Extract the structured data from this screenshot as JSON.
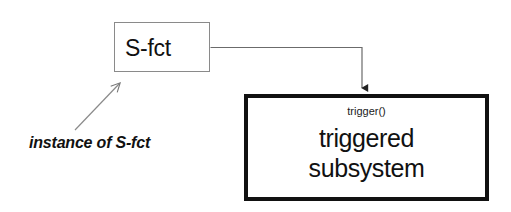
{
  "diagram": {
    "type": "block-diagram",
    "background_color": "#ffffff",
    "blocks": [
      {
        "id": "s-fct",
        "label": "S-fct",
        "border_color": "#8a8a8a",
        "fill_color": "#ffffff"
      },
      {
        "id": "triggered-subsystem",
        "port_label": "trigger()",
        "name_line_1": "triggered",
        "name_line_2": "subsystem",
        "border_color": "#111111",
        "fill_color": "#ffffff"
      }
    ],
    "connection": {
      "from": "s-fct",
      "to": "triggered-subsystem",
      "style": "orthogonal-arrow",
      "color": "#555555"
    },
    "annotation": {
      "text": "instance of S-fct",
      "points_to": "s-fct",
      "style": "italic-bold",
      "arrow_color": "#777777"
    }
  }
}
